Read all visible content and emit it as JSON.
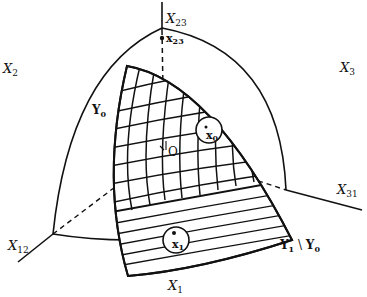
{
  "figure": {
    "type": "geometric-diagram",
    "colors": {
      "ink": "#111111",
      "background": "#ffffff"
    }
  },
  "labels": {
    "axis_x23": {
      "main": "X",
      "sub": "23"
    },
    "point_x23": {
      "main": "x",
      "sub": "23"
    },
    "axis_x2": {
      "main": "X",
      "sub": "2"
    },
    "axis_x3": {
      "main": "X",
      "sub": "3"
    },
    "region_y0": {
      "main": "Y",
      "sub": "0"
    },
    "point_x0": {
      "main": "x",
      "sub": "0"
    },
    "origin": {
      "main": "O"
    },
    "axis_x31": {
      "main": "X",
      "sub": "31"
    },
    "axis_x12": {
      "main": "X",
      "sub": "12"
    },
    "point_x1": {
      "main": "x",
      "sub": "1"
    },
    "region_y1_minus_y0": {
      "main1": "Y",
      "sub1": "1",
      "sep": " \\ ",
      "main2": "Y",
      "sub2": "0"
    },
    "axis_x1": {
      "main": "X",
      "sub": "1"
    }
  }
}
